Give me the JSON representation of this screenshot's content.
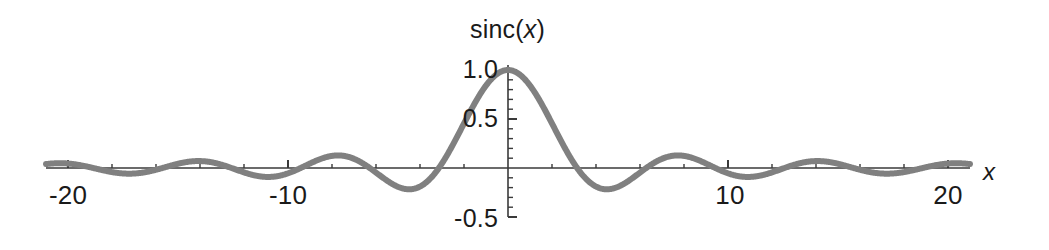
{
  "chart_data": {
    "type": "line",
    "title": "sinc(x)",
    "title_plain": "sinc",
    "title_var": "x",
    "xlabel": "x",
    "ylabel": "",
    "function": "sin(x)/x",
    "xlim": [
      -21.0,
      21.0
    ],
    "ylim": [
      -0.5,
      1.05
    ],
    "grid": false,
    "legend": null,
    "axis_origin": [
      0,
      0
    ],
    "x_ticks_major": [
      -20,
      -10,
      10,
      20
    ],
    "x_tick_labels": [
      "-20",
      "-10",
      "10",
      "20"
    ],
    "x_ticks_minor_step": 2,
    "y_ticks_major": [
      1.0,
      0.5,
      -0.5
    ],
    "y_tick_labels": [
      "1.0",
      "0.5",
      "-0.5"
    ],
    "y_ticks_minor_step": 0.1,
    "series": [
      {
        "name": "sinc(x)",
        "color": "#808080",
        "line_width": 6,
        "x": [
          -21,
          -20.5,
          -20,
          -19.5,
          -19,
          -18.5,
          -18,
          -17.5,
          -17,
          -16.5,
          -16,
          -15.5,
          -15,
          -14.5,
          -14,
          -13.5,
          -13,
          -12.5,
          -12,
          -11.5,
          -11,
          -10.5,
          -10,
          -9.5,
          -9,
          -8.5,
          -8,
          -7.5,
          -7,
          -6.5,
          -6,
          -5.5,
          -5,
          -4.5,
          -4,
          -3.5,
          -3,
          -2.5,
          -2,
          -1.5,
          -1,
          -0.5,
          0,
          0.5,
          1,
          1.5,
          2,
          2.5,
          3,
          3.5,
          4,
          4.5,
          5,
          5.5,
          6,
          6.5,
          7,
          7.5,
          8,
          8.5,
          9,
          9.5,
          10,
          10.5,
          11,
          11.5,
          12,
          12.5,
          13,
          13.5,
          14,
          14.5,
          15,
          15.5,
          16,
          16.5,
          17,
          17.5,
          18,
          18.5,
          19,
          19.5,
          20,
          20.5,
          21
        ],
        "y": [
          0.0398,
          0.0268,
          0.0456,
          0.0241,
          -0.0088,
          -0.0377,
          -0.0417,
          -0.0158,
          0.0228,
          0.0517,
          0.018,
          -0.0144,
          -0.0434,
          -0.0554,
          -0.0425,
          -0.0083,
          0.0323,
          0.0534,
          0.0447,
          0.0086,
          -0.0091,
          -0.0529,
          -0.0544,
          -0.0081,
          0.0458,
          0.0937,
          0.1237,
          0.1254,
          0.0939,
          0.0343,
          -0.0466,
          -0.128,
          -0.1918,
          -0.2172,
          -0.1892,
          -0.1002,
          0.047,
          0.2394,
          0.4546,
          0.665,
          0.8415,
          0.9589,
          1.0,
          0.9589,
          0.8415,
          0.665,
          0.4546,
          0.2394,
          0.047,
          -0.1002,
          -0.1892,
          -0.2172,
          -0.1918,
          -0.128,
          -0.0466,
          0.0343,
          0.0939,
          0.1254,
          0.1237,
          0.0937,
          0.0458,
          -0.0081,
          -0.0544,
          -0.0529,
          -0.0091,
          0.0086,
          0.0447,
          0.0534,
          0.0323,
          -0.0083,
          -0.0425,
          -0.0554,
          -0.0434,
          -0.0144,
          0.018,
          0.0517,
          0.0228,
          -0.0158,
          -0.0417,
          -0.0377,
          -0.0088,
          0.0241,
          0.0456,
          0.0268,
          0.0398
        ]
      }
    ],
    "colors": {
      "curve": "#808080",
      "axis": "#3a3a3a",
      "text": "#1a1a1a",
      "background": "#ffffff"
    }
  }
}
